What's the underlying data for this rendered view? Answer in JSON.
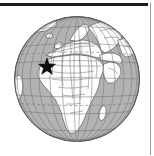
{
  "figure": {
    "kind": "orthographic-globe-locator-map",
    "caption": "",
    "rules": {
      "top_rule": {
        "name": "top-rule",
        "color": "#1c1c1c",
        "x": 0,
        "y": 3,
        "width": 148,
        "height": 3
      },
      "right_rule": {
        "name": "right-rule",
        "color": "#9a9a9a",
        "x": 150,
        "y": 3,
        "width": 1,
        "height": 152
      }
    }
  },
  "globe": {
    "projection": "orthographic",
    "center_x": 77,
    "center_y": 79,
    "radius": 63,
    "ocean_color": "#b3b3b3",
    "land_color": "#fdfdfd",
    "outline_color": "#4d4d4d",
    "border_color": "#6e6e6e",
    "graticule_color": "#7a6f6f",
    "graticule_step_degrees": 15,
    "center_lon": 15,
    "center_lat": 12
  },
  "marker": {
    "type": "star",
    "label": "star-marker",
    "color": "#0d0d0d",
    "points": 5,
    "x": 47,
    "y": 67,
    "outer_radius": 9,
    "inner_radius": 3.7,
    "region": "West Africa"
  },
  "graticule": {
    "dashed_latitudes": [
      -23.5,
      23.5
    ],
    "solid_latitudes": [
      -60,
      -45,
      -30,
      -15,
      0,
      15,
      30,
      45,
      60,
      75
    ],
    "meridians": [
      -75,
      -60,
      -45,
      -30,
      -15,
      0,
      15,
      30,
      45,
      60,
      75,
      90,
      105
    ]
  }
}
